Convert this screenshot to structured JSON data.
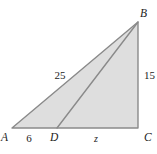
{
  "diagram": {
    "type": "geometry-triangle",
    "description_colors": {
      "triangle_fill": "#dedede",
      "line_stroke": "#8a8a8a",
      "text_color": "#1c1c1c",
      "background": "#ffffff"
    },
    "labels": {
      "vertex_a": "A",
      "vertex_b": "B",
      "vertex_c": "C",
      "vertex_d": "D",
      "side_ab": "25",
      "side_bc": "15",
      "segment_ad": "6",
      "segment_dc": "z"
    }
  }
}
